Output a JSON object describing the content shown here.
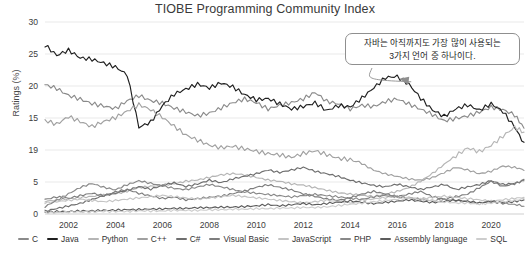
{
  "chart_data": {
    "type": "line",
    "title": "TIOBE Programming Community Index",
    "xlabel": "",
    "ylabel": "Ratings (%)",
    "xlim": [
      2001.0,
      2021.4
    ],
    "ylim": [
      0,
      30
    ],
    "grid": true,
    "legend_position": "bottom",
    "y_ticks": [
      30,
      25,
      20,
      15,
      19,
      5,
      0
    ],
    "y_tick_values": [
      30,
      25,
      20,
      15,
      10,
      5,
      0
    ],
    "x_ticks": [
      2002,
      2004,
      2006,
      2008,
      2010,
      2012,
      2014,
      2016,
      2018,
      2020
    ],
    "x": [
      2001.0,
      2001.5,
      2002.0,
      2002.5,
      2003.0,
      2003.5,
      2004.0,
      2004.5,
      2005.0,
      2005.5,
      2006.0,
      2006.5,
      2007.0,
      2007.5,
      2008.0,
      2008.5,
      2009.0,
      2009.5,
      2010.0,
      2010.5,
      2011.0,
      2011.5,
      2012.0,
      2012.5,
      2013.0,
      2013.5,
      2014.0,
      2014.5,
      2015.0,
      2015.5,
      2016.0,
      2016.5,
      2017.0,
      2017.5,
      2018.0,
      2018.5,
      2019.0,
      2019.5,
      2020.0,
      2020.5,
      2021.0,
      2021.4
    ],
    "series": [
      {
        "name": "C",
        "color": "#8a8a8a",
        "values": [
          20.2,
          19.6,
          18.5,
          17.9,
          17.2,
          16.8,
          16.4,
          17.6,
          18.4,
          17.6,
          17.2,
          16.4,
          15.8,
          15.2,
          15.6,
          16.4,
          17.2,
          17.8,
          17.2,
          16.2,
          16.8,
          17.2,
          17.8,
          18.8,
          17.4,
          17.0,
          16.2,
          16.8,
          16.6,
          17.4,
          17.8,
          17.0,
          16.2,
          15.4,
          14.4,
          14.8,
          15.2,
          15.8,
          16.6,
          16.2,
          15.4,
          13.4
        ]
      },
      {
        "name": "Java",
        "color": "#1f1f1f",
        "values": [
          26.2,
          24.6,
          25.4,
          24.2,
          24.0,
          23.4,
          22.8,
          21.6,
          13.4,
          14.2,
          16.8,
          18.6,
          19.4,
          20.2,
          19.6,
          20.4,
          19.8,
          18.6,
          17.8,
          18.0,
          17.2,
          16.4,
          16.8,
          17.4,
          16.2,
          17.0,
          16.8,
          18.2,
          19.8,
          21.4,
          21.6,
          20.4,
          18.2,
          16.4,
          15.4,
          16.6,
          17.2,
          16.4,
          17.4,
          16.2,
          13.8,
          11.2
        ]
      },
      {
        "name": "Python",
        "color": "#b5b5b5",
        "values": [
          2.0,
          2.2,
          2.4,
          2.6,
          2.8,
          3.0,
          3.2,
          3.6,
          4.2,
          4.4,
          4.6,
          4.8,
          5.2,
          5.4,
          5.8,
          6.2,
          6.4,
          6.2,
          5.8,
          5.4,
          5.2,
          4.8,
          4.6,
          4.2,
          3.8,
          3.4,
          3.2,
          3.0,
          2.8,
          3.2,
          3.6,
          4.2,
          5.2,
          6.4,
          7.8,
          9.2,
          10.4,
          9.8,
          10.8,
          12.2,
          13.6,
          12.8
        ]
      },
      {
        "name": "C++",
        "color": "#a0a0a0",
        "values": [
          14.8,
          14.2,
          15.4,
          14.6,
          13.8,
          14.6,
          15.2,
          16.2,
          17.2,
          16.4,
          15.2,
          13.8,
          12.4,
          11.6,
          10.8,
          10.4,
          10.6,
          10.2,
          9.8,
          9.4,
          9.2,
          8.8,
          9.4,
          9.8,
          9.2,
          8.6,
          8.4,
          7.8,
          6.8,
          6.2,
          5.8,
          5.4,
          5.2,
          5.6,
          6.4,
          7.2,
          6.8,
          6.2,
          6.6,
          7.4,
          7.2,
          6.8
        ]
      },
      {
        "name": "C#",
        "color": "#6e6e6e",
        "values": [
          0.4,
          0.8,
          1.2,
          1.6,
          2.2,
          2.8,
          3.2,
          3.6,
          4.2,
          3.8,
          4.4,
          4.8,
          4.2,
          4.6,
          5.2,
          4.8,
          5.4,
          5.8,
          6.2,
          6.8,
          6.4,
          6.8,
          7.2,
          6.6,
          6.2,
          5.8,
          5.2,
          4.8,
          4.4,
          4.2,
          4.6,
          4.2,
          3.8,
          4.2,
          4.6,
          3.8,
          4.2,
          4.6,
          5.2,
          4.6,
          4.8,
          5.2
        ]
      },
      {
        "name": "Visual Basic",
        "color": "#7d7d7d",
        "values": [
          2.2,
          2.6,
          2.4,
          2.8,
          3.2,
          2.8,
          3.4,
          3.8,
          3.2,
          2.8,
          2.4,
          2.6,
          2.2,
          2.4,
          2.6,
          2.8,
          3.2,
          3.6,
          4.2,
          4.6,
          4.2,
          3.8,
          3.2,
          2.8,
          2.4,
          2.2,
          2.6,
          3.2,
          3.6,
          3.2,
          2.8,
          3.2,
          3.6,
          2.8,
          2.4,
          2.8,
          3.2,
          4.2,
          5.2,
          4.4,
          4.8,
          5.4
        ]
      },
      {
        "name": "JavaScript",
        "color": "#c4c4c4",
        "values": [
          1.8,
          2.0,
          2.2,
          2.4,
          2.2,
          2.0,
          2.2,
          2.4,
          2.6,
          2.8,
          3.0,
          2.8,
          2.6,
          2.4,
          2.6,
          2.8,
          3.0,
          2.8,
          2.6,
          2.4,
          2.2,
          2.0,
          1.8,
          2.0,
          2.2,
          2.0,
          1.8,
          2.2,
          2.4,
          2.6,
          2.8,
          2.6,
          2.4,
          2.6,
          2.8,
          2.6,
          2.4,
          2.2,
          2.0,
          2.2,
          2.4,
          2.6
        ]
      },
      {
        "name": "PHP",
        "color": "#888888",
        "values": [
          1.2,
          2.2,
          3.2,
          4.2,
          4.8,
          4.2,
          3.8,
          4.6,
          5.2,
          4.8,
          4.4,
          4.0,
          3.8,
          4.2,
          4.6,
          4.2,
          3.8,
          3.4,
          3.2,
          3.0,
          2.8,
          2.6,
          2.8,
          3.0,
          2.8,
          2.6,
          2.4,
          2.2,
          2.6,
          2.8,
          2.6,
          2.4,
          2.2,
          2.0,
          2.2,
          2.0,
          1.8,
          1.6,
          1.8,
          1.6,
          1.4,
          1.2
        ]
      },
      {
        "name": "Assembly language",
        "color": "#5c5c5c",
        "values": [
          0.2,
          0.3,
          0.3,
          0.4,
          0.4,
          0.5,
          0.5,
          0.6,
          0.6,
          0.7,
          0.7,
          0.8,
          0.8,
          0.9,
          0.9,
          1.0,
          1.0,
          1.1,
          1.2,
          1.4,
          1.2,
          1.4,
          1.6,
          1.4,
          1.6,
          1.8,
          2.0,
          1.8,
          1.6,
          1.8,
          2.0,
          2.2,
          2.0,
          1.8,
          2.0,
          2.2,
          2.0,
          1.8,
          2.0,
          1.8,
          2.0,
          2.2
        ]
      },
      {
        "name": "SQL",
        "color": "#cdcdcd",
        "values": [
          0.2,
          0.2,
          0.3,
          0.3,
          0.3,
          0.4,
          0.4,
          0.4,
          0.5,
          0.5,
          0.5,
          0.6,
          0.6,
          0.6,
          0.7,
          0.7,
          0.8,
          0.8,
          0.9,
          0.9,
          1.0,
          1.0,
          1.1,
          1.1,
          1.2,
          1.4,
          1.6,
          1.8,
          2.0,
          2.2,
          2.4,
          2.6,
          2.4,
          2.2,
          2.0,
          1.8,
          1.8,
          1.6,
          1.8,
          2.0,
          2.2,
          2.4
        ]
      }
    ],
    "annotations": [
      {
        "name": "java-callout",
        "line1": "자바는 아직까지도 가장 많이 사용되는",
        "line2": "3가지 언어 중 하나이다.",
        "target_x": 2016.0,
        "target_y": 21.6
      }
    ]
  }
}
